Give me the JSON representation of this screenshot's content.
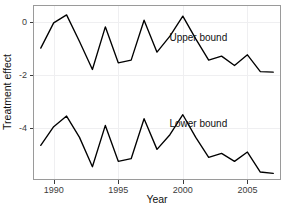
{
  "chart_data": {
    "type": "line",
    "title": "",
    "xlabel": "Year",
    "ylabel": "Treatment effect",
    "xlim": [
      1988.4,
      2007.6
    ],
    "ylim": [
      -5.95,
      0.62
    ],
    "xticks": [
      1990,
      1995,
      2000,
      2005
    ],
    "xtick_labels": [
      "1990",
      "1995",
      "2000",
      "2005"
    ],
    "yticks": [
      0,
      -2,
      -4
    ],
    "ytick_labels": [
      "0",
      "-2",
      "-4"
    ],
    "grid": true,
    "legend": "inline-annotations",
    "x": [
      1989,
      1990,
      1991,
      1992,
      1993,
      1994,
      1995,
      1996,
      1997,
      1998,
      1999,
      2000,
      2001,
      2002,
      2003,
      2004,
      2005,
      2006,
      2007
    ],
    "series": [
      {
        "name": "Upper bound",
        "label_x": 2001.2,
        "label_y": -0.75,
        "values": [
          -1.0,
          -0.05,
          0.25,
          -0.75,
          -1.8,
          -0.2,
          -1.55,
          -1.45,
          0.05,
          -1.15,
          -0.55,
          0.2,
          -0.65,
          -1.45,
          -1.3,
          -1.65,
          -1.25,
          -1.88,
          -1.9
        ]
      },
      {
        "name": "Lower bound",
        "label_x": 2001.2,
        "label_y": -3.95,
        "values": [
          -4.65,
          -3.95,
          -3.55,
          -4.35,
          -5.45,
          -3.9,
          -5.25,
          -5.15,
          -3.65,
          -4.8,
          -4.25,
          -3.5,
          -4.35,
          -5.1,
          -4.95,
          -5.25,
          -4.9,
          -5.65,
          -5.7
        ]
      }
    ],
    "colors": {
      "line": "#000000",
      "grid": "#efeff1",
      "panel_border": "#9a9a9a",
      "text": "#111111",
      "background": "#ffffff"
    }
  },
  "axes": {
    "x_title": "Year",
    "y_title": "Treatment effect"
  },
  "annotations": {
    "upper": "Upper bound",
    "lower": "Lower bound"
  }
}
